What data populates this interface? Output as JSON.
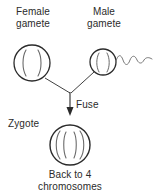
{
  "diagram": {
    "type": "biology-process-diagram",
    "colors": {
      "background": "#ffffff",
      "stroke": "#2b2b2b",
      "chromosome_stroke": "#5a5a5a",
      "text": "#2b2b2b"
    },
    "labels": {
      "female_gamete_line1": "Female",
      "female_gamete_line2": "gamete",
      "male_gamete_line1": "Male",
      "male_gamete_line2": "gamete",
      "fuse": "Fuse",
      "zygote": "Zygote",
      "caption_line1": "Back to 4",
      "caption_line2": "chromosomes"
    },
    "cells": [
      {
        "name": "female-gamete",
        "label": "Female gamete",
        "shape": "circle",
        "cx": 32,
        "cy": 63,
        "r": 18,
        "chromosome_count": 2,
        "has_flagellum": false
      },
      {
        "name": "male-gamete",
        "label": "Male gamete",
        "shape": "circle",
        "cx": 103,
        "cy": 62,
        "r": 13,
        "chromosome_count": 2,
        "has_flagellum": true
      },
      {
        "name": "zygote",
        "label": "Zygote",
        "shape": "circle",
        "cx": 70,
        "cy": 145,
        "r": 20,
        "chromosome_count": 4,
        "has_flagellum": false
      }
    ],
    "connectors": [
      {
        "name": "female-to-fusion",
        "from": "female-gamete",
        "to": "fusion-point",
        "style": "line"
      },
      {
        "name": "male-to-fusion",
        "from": "male-gamete",
        "to": "fusion-point",
        "style": "line"
      },
      {
        "name": "fusion-to-zygote",
        "from": "fusion-point",
        "to": "zygote",
        "style": "arrow",
        "label": "Fuse"
      }
    ]
  }
}
